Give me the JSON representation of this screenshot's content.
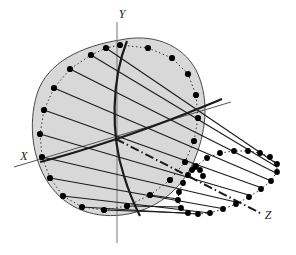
{
  "figure": {
    "background_color": "#ffffff",
    "ink_color": "#1a1a1a",
    "fill_color": "#d8d8d8",
    "fill_stroke_color": "#4a4a4a",
    "dot_color": "#000000"
  },
  "axes": {
    "x": {
      "label": "X",
      "label_x": 24,
      "label_y": 160,
      "line": {
        "x1": 14,
        "y1": 167,
        "x2": 231,
        "y2": 102
      }
    },
    "y": {
      "label": "Y",
      "label_x": 122,
      "label_y": 18,
      "line": {
        "x1": 117,
        "y1": 22,
        "x2": 117,
        "y2": 243
      }
    },
    "z": {
      "label": "Z",
      "label_x": 268,
      "label_y": 219,
      "line": {
        "x1": 116,
        "y1": 139,
        "x2": 262,
        "y2": 214
      }
    }
  },
  "shapes": {
    "blob_outline_path": "M 120 40 C 152 33 182 44 196 70 C 209 96 207 127 196 156 C 185 186 160 208 128 214 C 96 220 66 209 49 184 C 32 159 28 124 37 94 C 47 62 82 46 120 40 Z",
    "left_ellipse_cx": 120,
    "left_ellipse_cy": 128,
    "left_ellipse_rx": 73,
    "left_ellipse_ry": 83,
    "left_ellipse_rotation": -10,
    "right_loop_path": "M 196 166 C 208 154 228 150 248 151 C 266 152 278 158 277 167 C 276 178 266 188 249 198 C 232 208 211 214 196 214 C 181 214 176 206 178 196 C 181 182 187 174 196 166 Z",
    "bold_curve_1": "M 127 41 C 112 78 110 134 124 176 C 130 196 136 208 140 216",
    "bold_curve_2": "M 40 162 C 80 152 140 132 190 112 C 205 106 215 102 222 99"
  },
  "counts": {
    "left_ellipse_dots": 22,
    "right_loop_dots": 26,
    "generator_lines": 13
  },
  "chart_data": {
    "type": "scatter",
    "xlabel": "X",
    "ylabel": "Y",
    "zlabel": "Z",
    "legend": [],
    "grid": false,
    "left_ellipse_points": [
      [
        120,
        45
      ],
      [
        148,
        48
      ],
      [
        172,
        58
      ],
      [
        188,
        74
      ],
      [
        196,
        95
      ],
      [
        198,
        118
      ],
      [
        194,
        141
      ],
      [
        185,
        162
      ],
      [
        170,
        180
      ],
      [
        150,
        195
      ],
      [
        127,
        206
      ],
      [
        104,
        210
      ],
      [
        82,
        207
      ],
      [
        63,
        196
      ],
      [
        50,
        178
      ],
      [
        42,
        157
      ],
      [
        40,
        134
      ],
      [
        44,
        110
      ],
      [
        54,
        88
      ],
      [
        70,
        69
      ],
      [
        91,
        55
      ],
      [
        106,
        48
      ]
    ],
    "right_loop_points": [
      [
        196,
        166
      ],
      [
        207,
        158
      ],
      [
        220,
        153
      ],
      [
        234,
        151
      ],
      [
        248,
        151
      ],
      [
        260,
        153
      ],
      [
        270,
        157
      ],
      [
        277,
        164
      ],
      [
        277,
        172
      ],
      [
        271,
        181
      ],
      [
        261,
        189
      ],
      [
        249,
        197
      ],
      [
        236,
        204
      ],
      [
        223,
        209
      ],
      [
        210,
        213
      ],
      [
        198,
        214
      ],
      [
        188,
        213
      ],
      [
        181,
        208
      ],
      [
        178,
        200
      ],
      [
        179,
        192
      ],
      [
        183,
        183
      ],
      [
        188,
        175
      ],
      [
        192,
        170
      ],
      [
        195,
        167
      ],
      [
        200,
        170
      ],
      [
        203,
        176
      ]
    ],
    "generator_lines": [
      {
        "from": [
          106,
          48
        ],
        "to": [
          277,
          164
        ]
      },
      {
        "from": [
          91,
          55
        ],
        "to": [
          277,
          167
        ]
      },
      {
        "from": [
          70,
          69
        ],
        "to": [
          274,
          172
        ]
      },
      {
        "from": [
          54,
          88
        ],
        "to": [
          269,
          180
        ]
      },
      {
        "from": [
          44,
          110
        ],
        "to": [
          262,
          188
        ]
      },
      {
        "from": [
          40,
          134
        ],
        "to": [
          252,
          196
        ]
      },
      {
        "from": [
          42,
          157
        ],
        "to": [
          240,
          203
        ]
      },
      {
        "from": [
          50,
          178
        ],
        "to": [
          225,
          209
        ]
      },
      {
        "from": [
          63,
          196
        ],
        "to": [
          210,
          213
        ]
      },
      {
        "from": [
          82,
          207
        ],
        "to": [
          197,
          214
        ]
      },
      {
        "from": [
          104,
          210
        ],
        "to": [
          188,
          213
        ]
      },
      {
        "from": [
          127,
          206
        ],
        "to": [
          181,
          207
        ]
      },
      {
        "from": [
          150,
          195
        ],
        "to": [
          178,
          199
        ]
      }
    ]
  }
}
